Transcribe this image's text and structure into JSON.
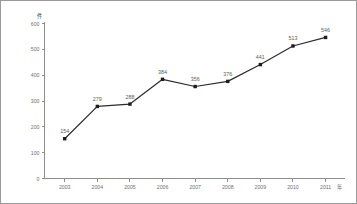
{
  "chart_data": {
    "type": "line",
    "title": "",
    "xlabel": "",
    "ylabel": "",
    "y_unit_label": "件",
    "x_unit_label": "年",
    "categories": [
      "2003",
      "2004",
      "2005",
      "2006",
      "2007",
      "2008",
      "2009",
      "2010",
      "2011"
    ],
    "values": [
      154,
      279,
      288,
      384,
      356,
      376,
      441,
      513,
      546
    ],
    "point_labels": [
      "154",
      "279",
      "288",
      "384",
      "356",
      "376",
      "441",
      "513",
      "546"
    ],
    "ylim": [
      0,
      600
    ],
    "yticks": [
      0,
      100,
      200,
      300,
      400,
      500,
      600
    ],
    "ytick_labels": [
      "0",
      "100",
      "200",
      "300",
      "400",
      "500",
      "600"
    ],
    "grid": false,
    "legend": false,
    "series": [
      {
        "name": "",
        "values": [
          154,
          279,
          288,
          384,
          356,
          376,
          441,
          513,
          546
        ],
        "line_color": "#2b2b2b",
        "marker_color": "#1d1d1d",
        "marker": "square"
      }
    ],
    "colors": {
      "axis": "#8d8d8d",
      "tick_text": "#6f6f6f",
      "label_text": "#5d5d5d",
      "background": "#ffffff",
      "border": "#9a9a9a"
    }
  }
}
